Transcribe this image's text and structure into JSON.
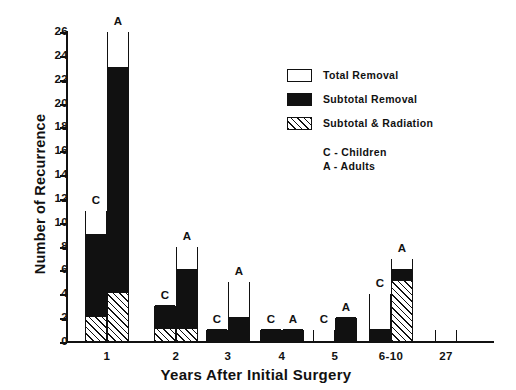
{
  "chart_data": {
    "type": "bar",
    "subtype": "stacked-grouped-bar",
    "title": "",
    "xlabel": "Years After Initial Surgery",
    "ylabel": "Number of Recurrence",
    "ylim": [
      0,
      26
    ],
    "ytick_step": 2,
    "yticks": [
      0,
      2,
      4,
      6,
      8,
      10,
      12,
      14,
      16,
      18,
      20,
      22,
      24,
      26
    ],
    "ytick_labels": [
      "0",
      "2",
      "4",
      "6",
      "8",
      "10",
      "12",
      "14",
      "16",
      "18",
      "20",
      "22",
      "24",
      "26"
    ],
    "grid": false,
    "legend_position": "upper-right-inside",
    "categories": [
      "1",
      "2",
      "3",
      "4",
      "5",
      "6-10",
      "27"
    ],
    "series": [
      {
        "name": "Total Removal",
        "key": "total",
        "fill": "white",
        "color": "#ffffff"
      },
      {
        "name": "Subtotal Removal",
        "key": "subtotal",
        "fill": "solid-black",
        "color": "#111111"
      },
      {
        "name": "Subtotal & Radiation",
        "key": "radiation",
        "fill": "diagonal-hatch",
        "color": "#111111"
      }
    ],
    "group_labels": {
      "C": "Children",
      "A": "Adults"
    },
    "groups": [
      {
        "category": "1",
        "bars": [
          {
            "tag": "C",
            "radiation": 2,
            "subtotal": 7,
            "total": 2,
            "sum": 11
          },
          {
            "tag": "A",
            "radiation": 4,
            "subtotal": 19,
            "total": 3,
            "sum": 26
          }
        ]
      },
      {
        "category": "2",
        "bars": [
          {
            "tag": "C",
            "radiation": 1,
            "subtotal": 2,
            "total": 0,
            "sum": 3
          },
          {
            "tag": "A",
            "radiation": 1,
            "subtotal": 5,
            "total": 2,
            "sum": 8
          }
        ]
      },
      {
        "category": "3",
        "bars": [
          {
            "tag": "C",
            "radiation": 0,
            "subtotal": 1,
            "total": 0,
            "sum": 1
          },
          {
            "tag": "A",
            "radiation": 0,
            "subtotal": 2,
            "total": 3,
            "sum": 5
          }
        ]
      },
      {
        "category": "4",
        "bars": [
          {
            "tag": "C",
            "radiation": 0,
            "subtotal": 1,
            "total": 0,
            "sum": 1
          },
          {
            "tag": "A",
            "radiation": 0,
            "subtotal": 1,
            "total": 0,
            "sum": 1
          }
        ]
      },
      {
        "category": "5",
        "bars": [
          {
            "tag": "C",
            "radiation": 0,
            "subtotal": 0,
            "total": 1,
            "sum": 1
          },
          {
            "tag": "A",
            "radiation": 0,
            "subtotal": 2,
            "total": 0,
            "sum": 2
          }
        ]
      },
      {
        "category": "6-10",
        "bars": [
          {
            "tag": "C",
            "radiation": 0,
            "subtotal": 1,
            "total": 3,
            "sum": 4
          },
          {
            "tag": "A",
            "radiation": 5,
            "subtotal": 1,
            "total": 1,
            "sum": 7
          }
        ]
      },
      {
        "category": "27",
        "bars": [
          {
            "tag": "",
            "radiation": 0,
            "subtotal": 0,
            "total": 1,
            "sum": 1
          }
        ]
      }
    ]
  },
  "axes": {
    "y_label": "Number of Recurrence",
    "x_label": "Years After Initial Surgery"
  },
  "legend": {
    "entries": [
      {
        "label": "Total  Removal",
        "fill": "total"
      },
      {
        "label": "Subtotal Removal",
        "fill": "subtotal"
      },
      {
        "label": "Subtotal & Radiation",
        "fill": "radiation"
      }
    ],
    "notes": [
      "C - Children",
      "A - Adults"
    ]
  },
  "colors": {
    "ink": "#111111",
    "paper": "#ffffff"
  }
}
